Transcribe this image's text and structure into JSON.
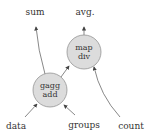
{
  "diagram": {
    "nodes": [
      {
        "id": "agg",
        "line1": "gagg",
        "line2": "add",
        "cx": 50,
        "cy": 90,
        "r": 17
      },
      {
        "id": "map",
        "line1": "map",
        "line2": "div",
        "cx": 84,
        "cy": 52,
        "r": 17
      }
    ],
    "labels": {
      "sum": "sum",
      "avg": "avg.",
      "data": "data",
      "groups": "groups",
      "count": "count"
    },
    "colors": {
      "node_fill": "#dcdcdc",
      "node_stroke": "#888888",
      "edge": "#555555"
    }
  }
}
